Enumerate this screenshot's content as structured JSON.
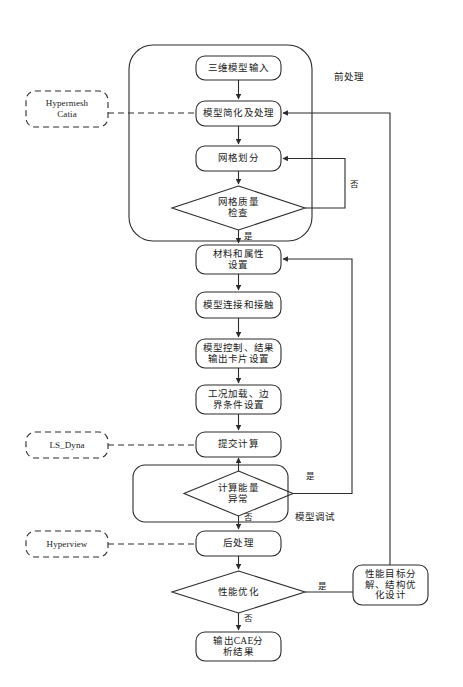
{
  "diagram": {
    "line_color": "#2b2b2b",
    "text_color": "#1a1a1a",
    "background": "#ffffff"
  },
  "groups": [
    {
      "id": "pre-processing",
      "label": "前处理"
    },
    {
      "id": "model-debug",
      "label": "模型调试"
    }
  ],
  "external_tools": [
    {
      "id": "hypermesh-catia",
      "label": "Hypermesh\nCatia",
      "style": "dashed"
    },
    {
      "id": "ls-dyna",
      "label": "LS_Dyna",
      "style": "dashed"
    },
    {
      "id": "hyperview",
      "label": "Hyperview",
      "style": "dashed"
    }
  ],
  "nodes": [
    {
      "id": "model-input",
      "type": "process",
      "label": "三维模型输入"
    },
    {
      "id": "model-simplify",
      "type": "process",
      "label": "模型简化及处理"
    },
    {
      "id": "mesh-division",
      "type": "process",
      "label": "网格划分"
    },
    {
      "id": "mesh-quality-check",
      "type": "decision",
      "label": "网格质量\n检查"
    },
    {
      "id": "material-property",
      "type": "process",
      "label": "材料和属性\n设置"
    },
    {
      "id": "model-connect",
      "type": "process",
      "label": "模型连接和接触"
    },
    {
      "id": "model-control",
      "type": "process",
      "label": "模型控制、结果\n输出卡片设置"
    },
    {
      "id": "load-boundary",
      "type": "process",
      "label": "工况加载、边\n界条件设置"
    },
    {
      "id": "submit-calc",
      "type": "process",
      "label": "提交计算"
    },
    {
      "id": "energy-abnormal",
      "type": "decision",
      "label": "计算能量\n异常"
    },
    {
      "id": "post-processing",
      "type": "process",
      "label": "后处理"
    },
    {
      "id": "perf-optimize",
      "type": "decision",
      "label": "性能优化"
    },
    {
      "id": "perf-target",
      "type": "process",
      "label": "性能目标分\n解、结构优\n化设计"
    },
    {
      "id": "output-cae",
      "type": "process",
      "label": "输出CAE分\n析结果"
    }
  ],
  "edge_labels": [
    {
      "id": "mesh-no",
      "label": "否",
      "from": "mesh-quality-check"
    },
    {
      "id": "mesh-yes",
      "label": "是",
      "from": "mesh-quality-check"
    },
    {
      "id": "energy-yes",
      "label": "是",
      "from": "energy-abnormal"
    },
    {
      "id": "energy-no",
      "label": "否",
      "from": "energy-abnormal"
    },
    {
      "id": "perf-yes",
      "label": "是",
      "from": "perf-optimize"
    },
    {
      "id": "perf-no",
      "label": "否",
      "from": "perf-optimize"
    }
  ]
}
